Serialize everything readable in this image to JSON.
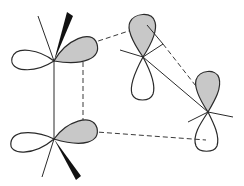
{
  "diagram": {
    "colors": {
      "shaded_lobe": "#c8c8c8",
      "outline": "#2a2a2a",
      "wedge": "#111111",
      "background": "#ffffff"
    },
    "centers": [
      {
        "id": "top-left-carbon",
        "shaded_lobe_direction": "right"
      },
      {
        "id": "bottom-left-carbon",
        "shaded_lobe_direction": "right"
      },
      {
        "id": "top-right-carbon",
        "shaded_lobe_direction": "up"
      },
      {
        "id": "bottom-right-carbon",
        "shaded_lobe_direction": "up"
      }
    ]
  }
}
